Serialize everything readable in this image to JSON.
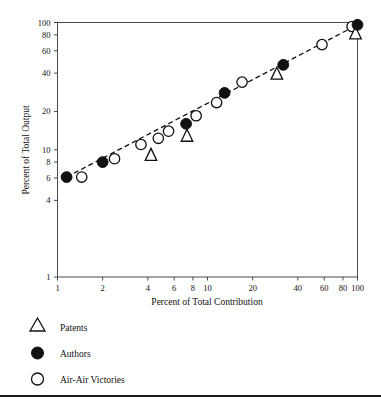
{
  "chart_data": {
    "type": "scatter",
    "title": "",
    "xlabel": "Percent of Total Contribution",
    "ylabel": "Percent of Total Output",
    "xscale": "log",
    "yscale": "log",
    "xlim": [
      1,
      100
    ],
    "ylim": [
      1,
      100
    ],
    "grid": false,
    "xticks": [
      1,
      2,
      4,
      6,
      8,
      10,
      20,
      40,
      60,
      80,
      100
    ],
    "xtick_labels": [
      "1",
      "2",
      "4",
      "6",
      "8",
      "10",
      "20",
      "40",
      "60",
      "80",
      "100"
    ],
    "yticks": [
      1,
      4,
      6,
      8,
      10,
      20,
      40,
      60,
      80,
      100
    ],
    "ytick_labels": [
      "1",
      "4",
      "6",
      "8",
      "10",
      "20",
      "40",
      "60",
      "80",
      "100"
    ],
    "legend_position": "below-left",
    "series": [
      {
        "name": "Patents",
        "marker": "open-triangle",
        "points": [
          {
            "x": 4.2,
            "y": 9.2
          },
          {
            "x": 7.3,
            "y": 13.0
          },
          {
            "x": 29.0,
            "y": 40.0
          },
          {
            "x": 97.0,
            "y": 83.0
          }
        ]
      },
      {
        "name": "Authors",
        "marker": "filled-circle",
        "points": [
          {
            "x": 1.15,
            "y": 6.1
          },
          {
            "x": 2.0,
            "y": 8.0
          },
          {
            "x": 7.2,
            "y": 16.0
          },
          {
            "x": 13.0,
            "y": 28.0
          },
          {
            "x": 32.0,
            "y": 46.5
          },
          {
            "x": 100.0,
            "y": 96.0
          }
        ]
      },
      {
        "name": "Air-Air Victories",
        "marker": "open-circle",
        "points": [
          {
            "x": 1.45,
            "y": 6.1
          },
          {
            "x": 2.4,
            "y": 8.5
          },
          {
            "x": 3.6,
            "y": 11.0
          },
          {
            "x": 4.7,
            "y": 12.3
          },
          {
            "x": 5.5,
            "y": 14.0
          },
          {
            "x": 8.4,
            "y": 18.5
          },
          {
            "x": 11.5,
            "y": 23.5
          },
          {
            "x": 17.0,
            "y": 34.0
          },
          {
            "x": 58.0,
            "y": 67.0
          },
          {
            "x": 92.0,
            "y": 93.0
          }
        ]
      }
    ],
    "trend_line": {
      "style": "dashed",
      "points": [
        {
          "x": 1.15,
          "y": 6.1
        },
        {
          "x": 100.0,
          "y": 96.0
        }
      ]
    }
  },
  "legend": {
    "items": [
      {
        "label": "Patents",
        "marker": "open-triangle"
      },
      {
        "label": "Authors",
        "marker": "filled-circle"
      },
      {
        "label": "Air-Air Victories",
        "marker": "open-circle"
      }
    ]
  }
}
